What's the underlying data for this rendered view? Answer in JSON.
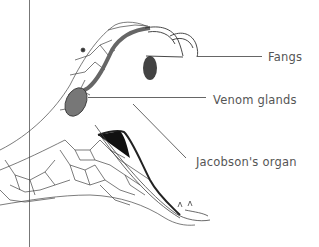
{
  "diagram": {
    "labels": {
      "fangs": "Fangs",
      "venom_glands": "Venom glands",
      "jacobsons_organ": "Jacobson's organ"
    },
    "colors": {
      "background": "#ffffff",
      "ink": "#333333",
      "label_text": "#555555",
      "gland_fill": "#777777",
      "leader_line": "#555555"
    }
  }
}
